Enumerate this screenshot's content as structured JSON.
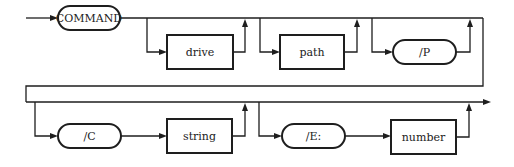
{
  "diagram": {
    "type": "railroad-syntax-diagram",
    "colors": {
      "stroke": "#1e1e1e",
      "background": "#ffffff"
    },
    "nodes": {
      "command": {
        "label": "COMMAND",
        "shape": "terminal-pill"
      },
      "drive": {
        "label": "drive",
        "shape": "nonterminal-box",
        "optional": true
      },
      "path": {
        "label": "path",
        "shape": "nonterminal-box",
        "optional": true
      },
      "p_switch": {
        "label": "/P",
        "shape": "terminal-pill",
        "optional": true
      },
      "c_switch": {
        "label": "/C",
        "shape": "terminal-pill",
        "optional": true
      },
      "string": {
        "label": "string",
        "shape": "nonterminal-box",
        "optional": true
      },
      "e_switch": {
        "label": "/E:",
        "shape": "terminal-pill",
        "optional": true
      },
      "number": {
        "label": "number",
        "shape": "nonterminal-box",
        "optional": true
      }
    },
    "sequence": [
      "COMMAND",
      "[drive]",
      "[path]",
      "[/P]",
      "[/C string]",
      "[/E: number]"
    ]
  }
}
